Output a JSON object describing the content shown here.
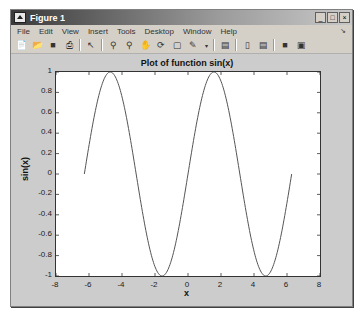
{
  "window": {
    "title": "Figure 1",
    "controls": {
      "minimize": "_",
      "maximize": "□",
      "close": "×"
    }
  },
  "menubar": {
    "items": [
      "File",
      "Edit",
      "View",
      "Insert",
      "Tools",
      "Desktop",
      "Window",
      "Help"
    ],
    "dock_icon": "dock-arrow-icon"
  },
  "toolbar": {
    "icons": [
      "new-figure-icon",
      "open-file-icon",
      "save-icon",
      "print-icon",
      "edit-plot-arrow-icon",
      "zoom-in-icon",
      "zoom-out-icon",
      "pan-hand-icon",
      "rotate-3d-icon",
      "data-cursor-icon",
      "brush-icon",
      "brush-dropdown-icon",
      "link-plot-icon",
      "insert-colorbar-icon",
      "insert-legend-icon",
      "hide-plot-tools-icon",
      "show-plot-tools-icon"
    ]
  },
  "chart_data": {
    "type": "line",
    "title": "Plot of function sin(x)",
    "xlabel": "x",
    "ylabel": "sin(x)",
    "xlim": [
      -8,
      8
    ],
    "ylim": [
      -1,
      1
    ],
    "xticks": [
      "-8",
      "-6",
      "-4",
      "-2",
      "0",
      "2",
      "4",
      "6",
      "8"
    ],
    "yticks": [
      "1",
      "0.8",
      "0.6",
      "0.4",
      "0.2",
      "0",
      "-0.2",
      "-0.4",
      "-0.6",
      "-0.8",
      "-1"
    ],
    "grid": false,
    "series": [
      {
        "name": "sin(x)",
        "function": "sin(x)",
        "x_range": [
          -6.2832,
          6.2832
        ],
        "color": "#555555",
        "x": [
          -6.28,
          -5.5,
          -4.71,
          -3.93,
          -3.14,
          -2.36,
          -1.57,
          -0.79,
          0,
          0.79,
          1.57,
          2.36,
          3.14,
          3.93,
          4.71,
          5.5,
          6.28
        ],
        "values": [
          0,
          0.71,
          1,
          0.71,
          0,
          -0.71,
          -1,
          -0.71,
          0,
          0.71,
          1,
          0.71,
          0,
          -0.71,
          -1,
          -0.71,
          0
        ]
      }
    ]
  }
}
